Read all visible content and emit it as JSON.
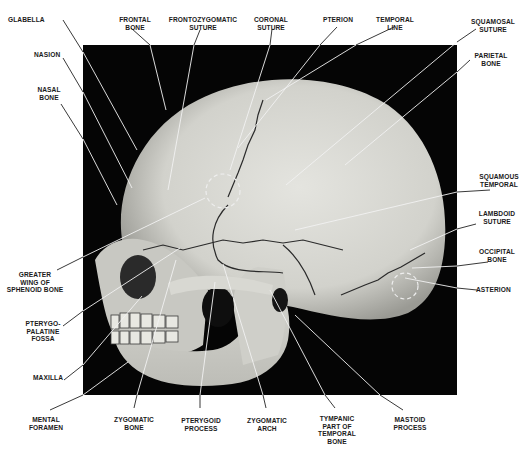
{
  "figure": {
    "background_color": "#ffffff",
    "photo_background": "#050505",
    "bone_color": "#d9d9d4",
    "suture_color": "#2a2a2a",
    "leader_line_color_outside": "#222222",
    "leader_line_color_inside": "#f2f2f2"
  },
  "labels": {
    "glabella": "GLABELLA",
    "frontal_bone": "FRONTAL\nBONE",
    "frontozygomatic_suture": "FRONTOZYGOMATIC\nSUTURE",
    "coronal_suture": "CORONAL\nSUTURE",
    "pterion": "PTERION",
    "temporal_line": "TEMPORAL\nLINE",
    "squamosal_suture": "SQUAMOSAL\nSUTURE",
    "parietal_bone": "PARIETAL\nBONE",
    "nasion": "NASION",
    "nasal_bone": "NASAL\nBONE",
    "squamous_temporal": "SQUAMOUS\nTEMPORAL",
    "lambdoid_suture": "LAMBDOID\nSUTURE",
    "occipital_bone": "OCCIPITAL\nBONE",
    "asterion": "ASTERION",
    "greater_wing_sphenoid": "GREATER\nWING OF\nSPHENOID BONE",
    "pterygopalatine_fossa": "PTERYGO-\nPALATINE\nFOSSA",
    "maxilla": "MAXILLA",
    "mental_foramen": "MENTAL\nFORAMEN",
    "zygomatic_bone": "ZYGOMATIC\nBONE",
    "pterygoid_process": "PTERYGOID\nPROCESS",
    "zygomatic_arch": "ZYGOMATIC\nARCH",
    "tympanic_part": "TYMPANIC\nPART OF\nTEMPORAL\nBONE",
    "mastoid_process": "MASTOID\nPROCESS"
  }
}
